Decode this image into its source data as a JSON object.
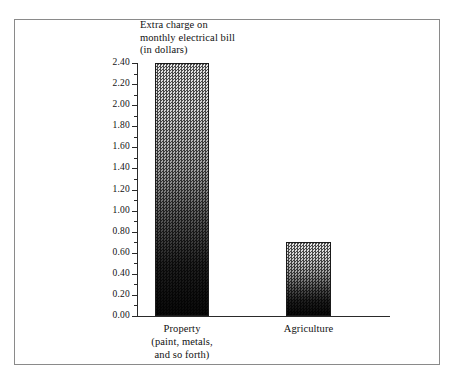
{
  "chart_data": {
    "type": "bar",
    "title": "Extra charge on\nmonthly electrical bill\n(in dollars)",
    "xlabel": "",
    "ylabel": "Extra charge on monthly electrical bill (in dollars)",
    "categories": [
      "Property\n(paint, metals,\nand so forth)",
      "Agriculture"
    ],
    "category_names": [
      "Property",
      "Agriculture"
    ],
    "values": [
      2.4,
      0.7
    ],
    "ylim": [
      0.0,
      2.4
    ],
    "ytick_step": 0.2,
    "yticks": [
      "0.00",
      "0.20",
      "0.40",
      "0.60",
      "0.80",
      "1.00",
      "1.20",
      "1.40",
      "1.60",
      "1.80",
      "2.00",
      "2.20",
      "2.40"
    ],
    "grid": false,
    "legend": null,
    "bar_fill": "gray-dither-gradient",
    "bar_edge_color": "#1a1a1a",
    "axis_color": "#2a2a2a",
    "frame_color": "#8a8a8a",
    "background": "#ffffff"
  },
  "axis": {
    "title_line1": "Extra charge on",
    "title_line2": "monthly electrical bill",
    "title_line3": "(in dollars)"
  },
  "ticks": [
    {
      "label": "2.40",
      "value": 2.4
    },
    {
      "label": "2.20",
      "value": 2.2
    },
    {
      "label": "2.00",
      "value": 2.0
    },
    {
      "label": "1.80",
      "value": 1.8
    },
    {
      "label": "1.60",
      "value": 1.6
    },
    {
      "label": "1.40",
      "value": 1.4
    },
    {
      "label": "1.20",
      "value": 1.2
    },
    {
      "label": "1.00",
      "value": 1.0
    },
    {
      "label": "0.80",
      "value": 0.8
    },
    {
      "label": "0.60",
      "value": 0.6
    },
    {
      "label": "0.40",
      "value": 0.4
    },
    {
      "label": "0.20",
      "value": 0.2
    },
    {
      "label": "0.00",
      "value": 0.0
    }
  ],
  "bars": [
    {
      "name": "property",
      "value": 2.4,
      "label": "Property\n(paint, metals,\nand so forth)"
    },
    {
      "name": "agriculture",
      "value": 0.7,
      "label": "Agriculture"
    }
  ]
}
